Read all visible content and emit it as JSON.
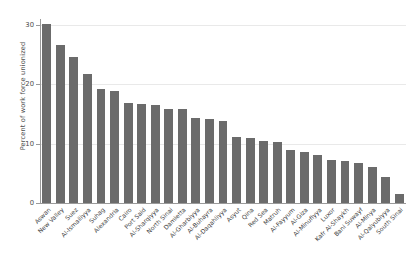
{
  "chart_data": {
    "type": "bar",
    "title": "",
    "xlabel": "",
    "ylabel": "Percent of work force unionized",
    "ylim": [
      0,
      31
    ],
    "yticks": [
      0,
      10,
      20,
      30
    ],
    "grid": true,
    "legend": null,
    "bar_color": "#6b6b6b",
    "categories": [
      "Aswan",
      "New Valley",
      "Suez",
      "Al-Ismailiyya",
      "Suhag",
      "Alexandria",
      "Cairo",
      "Port Said",
      "Al-Sharqiyya",
      "North Sinai",
      "Damietta",
      "Al-Gharbiyya",
      "Al-Buhayra",
      "Al-Daqahliyya",
      "Asyut",
      "Qina",
      "Red Sea",
      "Matruh",
      "Al-Fayyum",
      "Al-Giza",
      "Al-Minufiyya",
      "Luxor",
      "Kafr Al-Shaykh",
      "Bani Suwayf",
      "Al-Minya",
      "Al-Qalyubiyya",
      "South Sinai"
    ],
    "values": [
      30.2,
      26.7,
      24.6,
      21.8,
      19.2,
      18.8,
      16.8,
      16.6,
      16.5,
      15.9,
      15.8,
      14.3,
      14.2,
      13.9,
      11.2,
      10.9,
      10.5,
      10.2,
      9.0,
      8.6,
      8.1,
      7.3,
      7.0,
      6.8,
      6.0,
      4.3,
      1.5
    ]
  },
  "axis": {
    "ytick_labels": [
      "0",
      "10",
      "20",
      "30"
    ]
  }
}
